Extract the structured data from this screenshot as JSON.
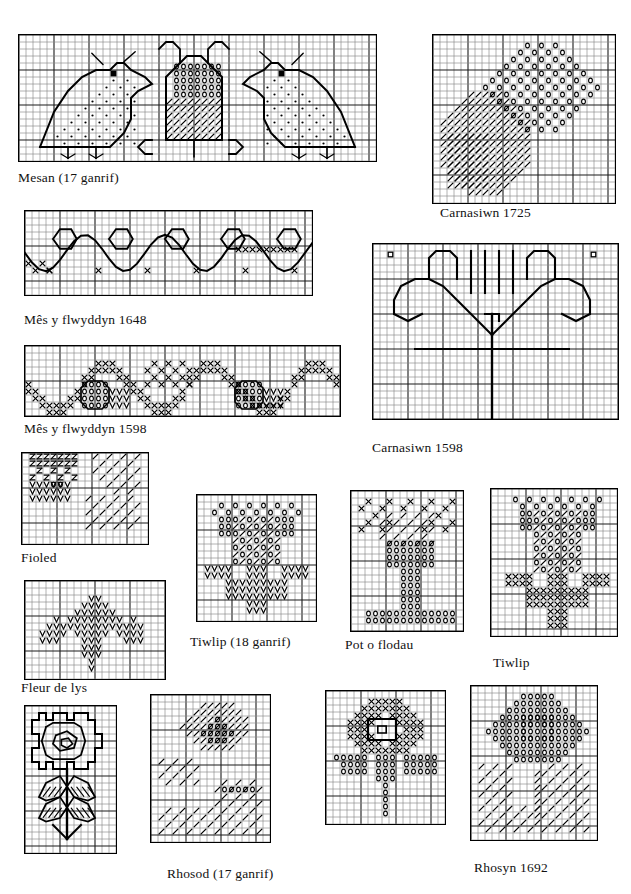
{
  "page": {
    "kind": "welsh-embroidery-pattern-sheet",
    "width": 631,
    "height": 894,
    "background": "#ffffff",
    "ink": "#000000",
    "grid_line_light": "#8a8a8a",
    "grid_line_heavy": "#1a1a1a",
    "cell_px": 7,
    "heavy_every": 5
  },
  "charts": [
    {
      "id": "mesan-17",
      "caption": "Mesan (17 ganrif)",
      "x": 18,
      "y": 34,
      "cols": 51,
      "rows": 18,
      "caption_x": 18,
      "caption_y": 170,
      "motif": "three-birds",
      "symbols": [
        "dot",
        "circle",
        "diagonal-slash",
        "outline"
      ]
    },
    {
      "id": "mes-y-flwyddyn-1648",
      "caption": "Mês y flwyddyn 1648",
      "x": 24,
      "y": 210,
      "cols": 41,
      "rows": 12,
      "caption_x": 24,
      "caption_y": 312,
      "motif": "scrolling-vine-border",
      "symbols": [
        "outline",
        "cross"
      ]
    },
    {
      "id": "mes-y-flwyddyn-1598",
      "caption": "Mês y flwyddyn 1598",
      "x": 24,
      "y": 345,
      "cols": 45,
      "rows": 10,
      "caption_x": 24,
      "caption_y": 421,
      "motif": "acorn-vine-border",
      "symbols": [
        "cross",
        "circle",
        "vee"
      ]
    },
    {
      "id": "carnasiwn-1725",
      "caption": "Carnasiwn 1725",
      "x": 432,
      "y": 34,
      "cols": 26,
      "rows": 24,
      "caption_x": 440,
      "caption_y": 205,
      "motif": "carnation",
      "symbols": [
        "circle",
        "diagonal-slash"
      ]
    },
    {
      "id": "carnasiwn-1598",
      "caption": "Carnasiwn 1598",
      "x": 372,
      "y": 243,
      "cols": 35,
      "rows": 25,
      "caption_x": 372,
      "caption_y": 440,
      "motif": "carnation-outline",
      "symbols": [
        "outline"
      ]
    },
    {
      "id": "fioled",
      "caption": "Fioled",
      "x": 21,
      "y": 452,
      "cols": 18,
      "rows": 13,
      "caption_x": 21,
      "caption_y": 550,
      "motif": "violet",
      "symbols": [
        "zed",
        "vee",
        "circle",
        "diagonal-slash"
      ]
    },
    {
      "id": "fleur-de-lys",
      "caption": "Fleur de lys",
      "x": 24,
      "y": 580,
      "cols": 20,
      "rows": 14,
      "caption_x": 21,
      "caption_y": 680,
      "motif": "fleur-de-lys",
      "symbols": [
        "vee"
      ]
    },
    {
      "id": "tiwlip-18",
      "caption": "Tiwlip (18 ganrif)",
      "x": 196,
      "y": 494,
      "cols": 17,
      "rows": 18,
      "caption_x": 190,
      "caption_y": 634,
      "motif": "tulip",
      "symbols": [
        "circle",
        "diagonal-slash",
        "vee"
      ]
    },
    {
      "id": "pot-o-flodau",
      "caption": "Pot o flodau",
      "x": 350,
      "y": 490,
      "cols": 16,
      "rows": 20,
      "caption_x": 345,
      "caption_y": 637,
      "motif": "pot-of-flowers",
      "symbols": [
        "cross",
        "circle",
        "diagonal-slash"
      ]
    },
    {
      "id": "tiwlip",
      "caption": "Tiwlip",
      "x": 490,
      "y": 488,
      "cols": 18,
      "rows": 21,
      "caption_x": 493,
      "caption_y": 655,
      "motif": "tulip",
      "symbols": [
        "circle",
        "diagonal-slash",
        "cross"
      ]
    },
    {
      "id": "rhosyn-plant",
      "caption": "",
      "x": 24,
      "y": 705,
      "cols": 13,
      "rows": 21,
      "caption_x": 0,
      "caption_y": 0,
      "motif": "rose-and-stem-outline",
      "symbols": [
        "outline",
        "diagonal-slash"
      ]
    },
    {
      "id": "rhosod-17-a",
      "caption": "Rhosod (17 ganrif)",
      "x": 150,
      "y": 694,
      "cols": 17,
      "rows": 21,
      "caption_x": 167,
      "caption_y": 866,
      "motif": "roses",
      "symbols": [
        "diagonal-slash",
        "circle"
      ]
    },
    {
      "id": "rhosod-17-b",
      "caption": "",
      "x": 325,
      "y": 690,
      "cols": 17,
      "rows": 19,
      "caption_x": 0,
      "caption_y": 0,
      "motif": "rose-cross",
      "symbols": [
        "cross",
        "circle",
        "outline"
      ]
    },
    {
      "id": "rhosyn-1692",
      "caption": "Rhosyn 1692",
      "x": 470,
      "y": 685,
      "cols": 18,
      "rows": 22,
      "caption_x": 474,
      "caption_y": 860,
      "motif": "rose",
      "symbols": [
        "circle",
        "diagonal-slash"
      ]
    }
  ]
}
